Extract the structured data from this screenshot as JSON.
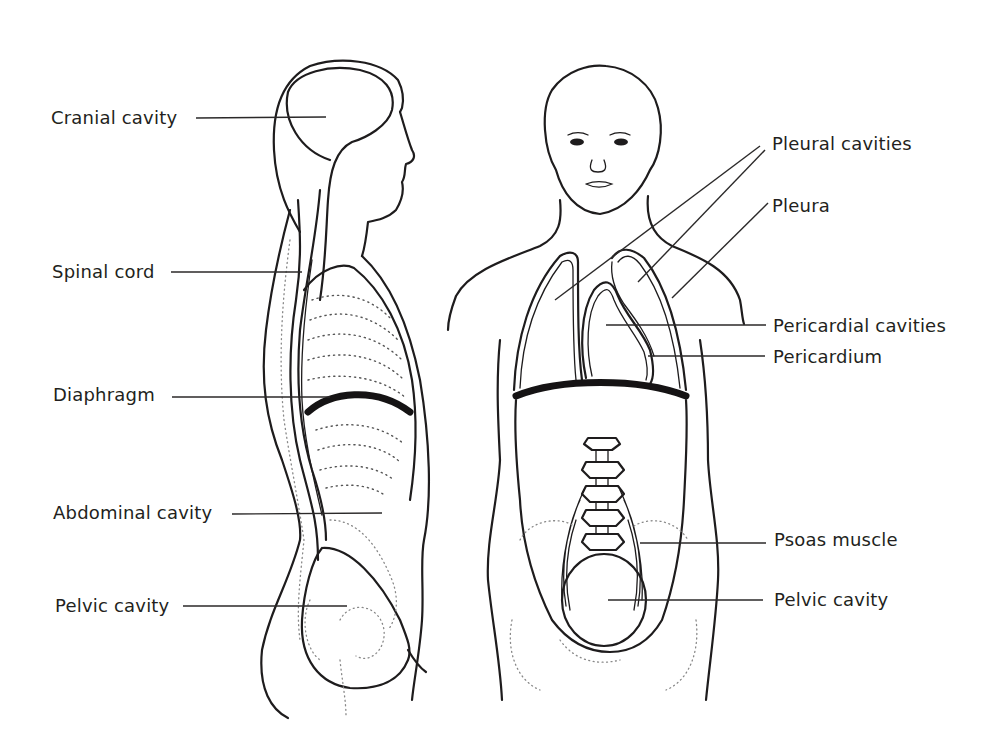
{
  "diagram": {
    "views": [
      "lateral",
      "anterior"
    ],
    "colors": {
      "ink": "#1e1c1d",
      "background": "#ffffff",
      "label_text": "#231f20"
    },
    "lateral_labels": [
      {
        "id": "cranial-cavity",
        "text": "Cranial cavity"
      },
      {
        "id": "spinal-cord",
        "text": "Spinal cord"
      },
      {
        "id": "diaphragm",
        "text": "Diaphragm"
      },
      {
        "id": "abdominal-cavity",
        "text": "Abdominal cavity"
      },
      {
        "id": "pelvic-cavity-lateral",
        "text": "Pelvic cavity"
      }
    ],
    "anterior_labels": [
      {
        "id": "pleural-cavities",
        "text": "Pleural cavities"
      },
      {
        "id": "pleura",
        "text": "Pleura"
      },
      {
        "id": "pericardial-cavities",
        "text": "Pericardial cavities"
      },
      {
        "id": "pericardium",
        "text": "Pericardium"
      },
      {
        "id": "psoas-muscle",
        "text": "Psoas muscle"
      },
      {
        "id": "pelvic-cavity-anterior",
        "text": "Pelvic cavity"
      }
    ]
  }
}
